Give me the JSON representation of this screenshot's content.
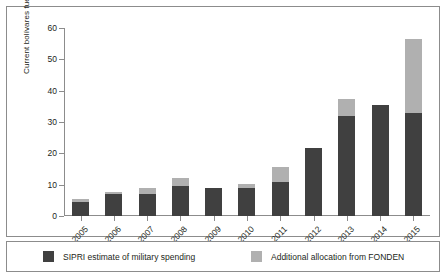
{
  "chart_data": {
    "type": "bar",
    "stacked": true,
    "title": "",
    "xlabel": "",
    "ylabel": "Current bolívares fuertes b.",
    "categories": [
      "2005",
      "2006",
      "2007",
      "2008",
      "2009",
      "2010",
      "2011",
      "2012",
      "2013",
      "2014",
      "2015"
    ],
    "yticks": [
      0,
      10,
      20,
      30,
      40,
      50,
      60
    ],
    "ylim": [
      0,
      60
    ],
    "grid": false,
    "legend_position": "bottom",
    "series": [
      {
        "name": "SIPRI estimate of military spending",
        "color": "#404040",
        "values": [
          4.5,
          7.0,
          7.0,
          9.6,
          9.0,
          9.0,
          11.0,
          21.7,
          32.0,
          35.3,
          33.0
        ]
      },
      {
        "name": "Additional allocation from FONDEN",
        "color": "#b0b0b0",
        "values": [
          1.0,
          0.6,
          2.0,
          2.4,
          0.0,
          1.3,
          4.5,
          0.0,
          5.5,
          0.0,
          23.5
        ]
      }
    ],
    "totals": [
      5.5,
      7.6,
      9.0,
      12.0,
      9.0,
      10.3,
      15.5,
      21.7,
      37.5,
      35.3,
      56.5
    ]
  },
  "legend": {
    "items": [
      {
        "label": "SIPRI estimate of military spending",
        "color": "#404040"
      },
      {
        "label": "Additional allocation from FONDEN",
        "color": "#b0b0b0"
      }
    ]
  }
}
